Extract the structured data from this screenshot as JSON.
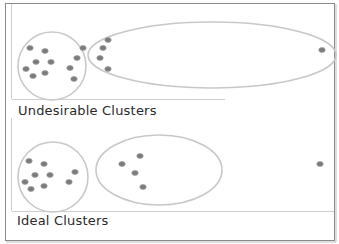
{
  "colors": {
    "frame": "#8a8a8a",
    "outline": "#c8c8c8",
    "point": "#7a7a7a",
    "text": "#2a2a2a"
  },
  "panels": [
    {
      "label": "Undesirable Clusters",
      "clusters": [
        {
          "shape": "circle",
          "cx": 52,
          "cy": 66,
          "r": 34
        },
        {
          "shape": "ellipse",
          "cx": 212,
          "cy": 55,
          "rx": 124,
          "ry": 33
        }
      ],
      "points": [
        [
          30,
          48
        ],
        [
          45,
          51
        ],
        [
          36,
          62
        ],
        [
          51,
          62
        ],
        [
          26,
          69
        ],
        [
          33,
          76
        ],
        [
          45,
          73
        ],
        [
          83,
          48
        ],
        [
          77,
          58
        ],
        [
          70,
          68
        ],
        [
          74,
          79
        ],
        [
          108,
          40
        ],
        [
          103,
          48
        ],
        [
          100,
          58
        ],
        [
          108,
          69
        ],
        [
          322,
          50
        ]
      ]
    },
    {
      "label": "Ideal  Clusters",
      "clusters": [
        {
          "shape": "circle",
          "cx": 53,
          "cy": 177,
          "r": 35
        },
        {
          "shape": "ellipse",
          "cx": 159,
          "cy": 170,
          "rx": 63,
          "ry": 35
        }
      ],
      "points": [
        [
          29,
          161
        ],
        [
          44,
          164
        ],
        [
          35,
          175
        ],
        [
          50,
          175
        ],
        [
          25,
          182
        ],
        [
          31,
          189
        ],
        [
          44,
          186
        ],
        [
          75,
          172
        ],
        [
          69,
          182
        ],
        [
          122,
          164
        ],
        [
          140,
          156
        ],
        [
          135,
          173
        ],
        [
          143,
          187
        ],
        [
          320,
          164
        ]
      ]
    }
  ]
}
